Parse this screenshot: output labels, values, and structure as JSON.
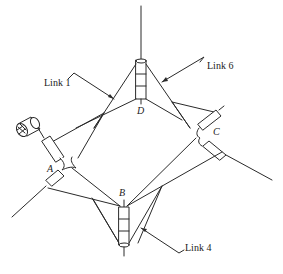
{
  "figure": {
    "type": "spatial-linkage-mechanism",
    "line_color": "#2a2a2a",
    "background": "#ffffff"
  },
  "labels": {
    "link1": "Link 1",
    "link4": "Link 4",
    "link6": "Link 6"
  },
  "joints": {
    "a": "A",
    "b": "B",
    "c": "C",
    "d": "D"
  },
  "icons": [
    "motor-icon",
    "revolute-joint-icon",
    "shaft-icon"
  ]
}
